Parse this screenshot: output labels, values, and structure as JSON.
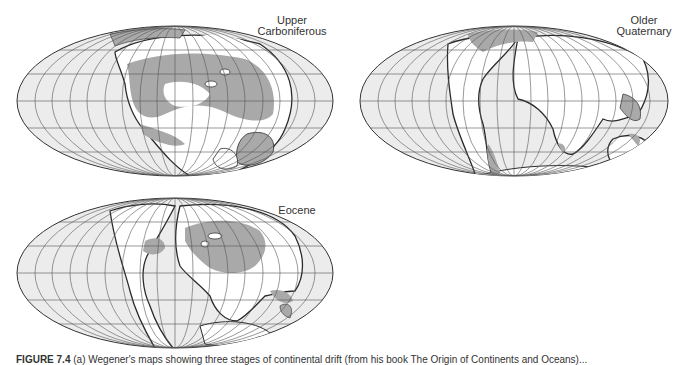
{
  "figure": {
    "colors": {
      "ocean": "#ececec",
      "land": "#ffffff",
      "shallow_sea": "#a9a9a9",
      "outline": "#2a2a2a",
      "graticule": "#555555"
    },
    "maps": [
      {
        "id": "upper-carboniferous",
        "label_line1": "Upper",
        "label_line2": "Carboniferous"
      },
      {
        "id": "older-quaternary",
        "label_line1": "Older",
        "label_line2": "Quaternary"
      },
      {
        "id": "eocene",
        "label_line1": "Eocene",
        "label_line2": ""
      }
    ],
    "caption": {
      "prefix": "FIGURE 7.4",
      "text": "(a) Wegener's maps showing three stages of continental drift (from his book The Origin of Continents and Oceans)..."
    }
  }
}
